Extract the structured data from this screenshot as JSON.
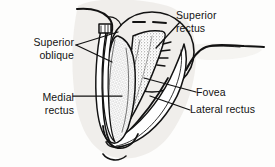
{
  "figure": {
    "labels": {
      "superior_oblique": "Superior\noblique",
      "superior_rectus": "Superior\nrectus",
      "medial_rectus": "Medial\nrectus",
      "fovea": "Fovea",
      "lateral_rectus": "Lateral rectus"
    },
    "colors": {
      "ink": "#121212",
      "paper": "#fdfdfc",
      "tint": "#ebe9e6",
      "stipple": "#8a8a88"
    }
  }
}
